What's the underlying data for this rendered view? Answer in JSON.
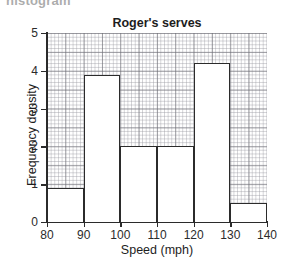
{
  "page": {
    "cropped_text_fragment": "histogram"
  },
  "chart_data": {
    "type": "bar",
    "title": "Roger's serves",
    "xlabel": "Speed (mph)",
    "ylabel": "Frequency density",
    "xlim": [
      80,
      140
    ],
    "ylim": [
      0,
      5
    ],
    "xticks": [
      80,
      90,
      100,
      110,
      120,
      130,
      140
    ],
    "yticks": [
      0,
      1,
      2,
      3,
      4,
      5
    ],
    "xtick_labels": [
      "80",
      "90",
      "100",
      "110",
      "120",
      "130",
      "140"
    ],
    "ytick_labels": [
      "0",
      "1",
      "2",
      "3",
      "4",
      "5"
    ],
    "grid": true,
    "legend": null,
    "bin_edges": [
      80,
      90,
      100,
      110,
      120,
      130,
      140
    ],
    "categories": [
      "80-90",
      "90-100",
      "100-110",
      "110-120",
      "120-130",
      "130-140"
    ],
    "values": [
      0.9,
      3.9,
      2.0,
      2.0,
      4.2,
      0.5
    ],
    "bars": [
      {
        "label": "80-90",
        "x0": 80,
        "x1": 90,
        "density": 0.9
      },
      {
        "label": "90-100",
        "x0": 90,
        "x1": 100,
        "density": 3.9
      },
      {
        "label": "100-110",
        "x0": 100,
        "x1": 110,
        "density": 2.0
      },
      {
        "label": "110-120",
        "x0": 110,
        "x1": 120,
        "density": 2.0
      },
      {
        "label": "120-130",
        "x0": 120,
        "x1": 130,
        "density": 4.2
      },
      {
        "label": "130-140",
        "x0": 130,
        "x1": 140,
        "density": 0.5
      }
    ],
    "colors": {
      "bar_fill": "#ffffff",
      "bar_outline": "#2b2b2b",
      "grid_major": "#69697045",
      "grid_minor": "#96969e30",
      "axis": "#2b2b2b",
      "text": "#1d1d1d"
    }
  }
}
